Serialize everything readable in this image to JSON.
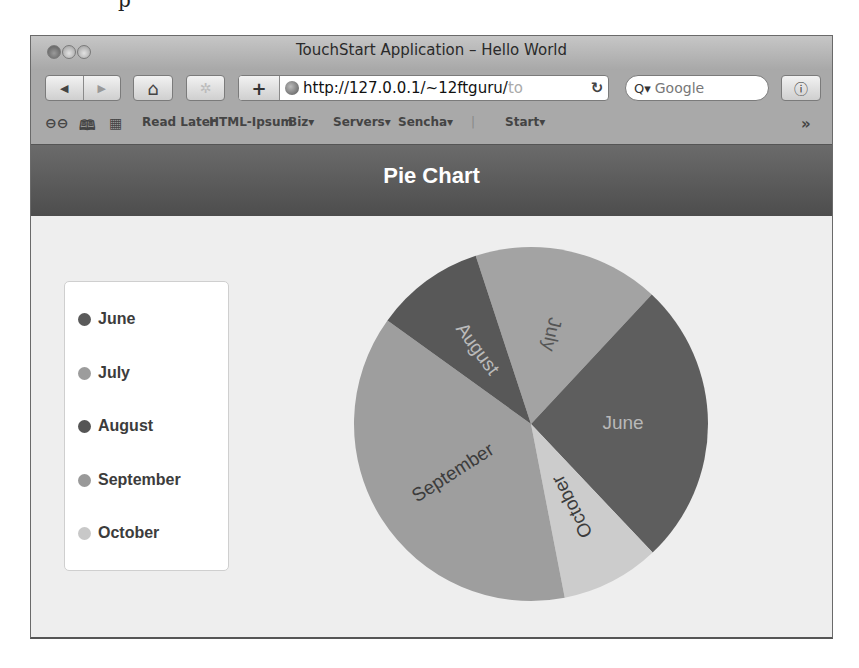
{
  "page_fragment": "p",
  "window": {
    "title": "TouchStart Application – Hello World"
  },
  "toolbar": {
    "back_icon": "◀",
    "forward_icon": "▶",
    "home_icon": "⌂",
    "disabled_icon": "✲",
    "add_icon": "+",
    "url_main": "http://127.0.0.1/~12ftguru/",
    "url_faded": "to",
    "reload_icon": "↻",
    "search_icon": "Q▾",
    "search_placeholder": "Google",
    "info_icon": "ⓘ"
  },
  "bookmarks": {
    "reading_list_icon": "⊖⊖",
    "book_icon": "🕮",
    "grid_icon": "▦",
    "items": [
      "Read Later",
      "HTML-Ipsum",
      "Biz▾",
      "Servers▾",
      "Sencha▾",
      "|",
      "Start▾"
    ],
    "overflow_icon": "»"
  },
  "app": {
    "title": "Pie Chart"
  },
  "legend": {
    "items": [
      {
        "label": "June",
        "color": "#5a5a5a"
      },
      {
        "label": "July",
        "color": "#9c9c9c"
      },
      {
        "label": "August",
        "color": "#555555"
      },
      {
        "label": "September",
        "color": "#999999"
      },
      {
        "label": "October",
        "color": "#c8c8c8"
      }
    ]
  },
  "chart_data": {
    "type": "pie",
    "title": "Pie Chart",
    "legend_position": "left",
    "start_angle_deg": 341.8,
    "slices": [
      {
        "label": "July",
        "value": 17,
        "color": "#a3a3a3",
        "text_color": "#555555"
      },
      {
        "label": "June",
        "value": 26,
        "color": "#5e5e5e",
        "text_color": "#b8b8b8"
      },
      {
        "label": "October",
        "value": 9,
        "color": "#cccccc",
        "text_color": "#3c3c3c"
      },
      {
        "label": "September",
        "value": 38,
        "color": "#9e9e9e",
        "text_color": "#3c3c3c"
      },
      {
        "label": "August",
        "value": 10,
        "color": "#585858",
        "text_color": "#bbbbbb"
      }
    ]
  }
}
